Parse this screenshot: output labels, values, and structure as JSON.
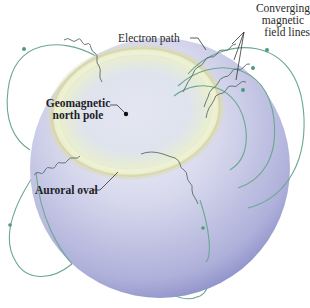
{
  "diagram": {
    "labels": {
      "electron_path": "Electron path",
      "field_lines_line1": "Converging",
      "field_lines_line2": "magnetic",
      "field_lines_line3": "field lines",
      "pole_line1": "Geomagnetic",
      "pole_line2": "north pole",
      "auroral_oval": "Auroral oval"
    },
    "colors": {
      "globe_light": "#eef0f6",
      "globe_mid": "#c3c5e2",
      "globe_dark": "#8d90c8",
      "oval_glow": "#e6ecc6",
      "oval_rim": "#d8d6a8",
      "field_line": "#6aa890",
      "electron_path": "#5a6a70",
      "leader_line": "#333333",
      "text": "#2a2a2a"
    }
  }
}
